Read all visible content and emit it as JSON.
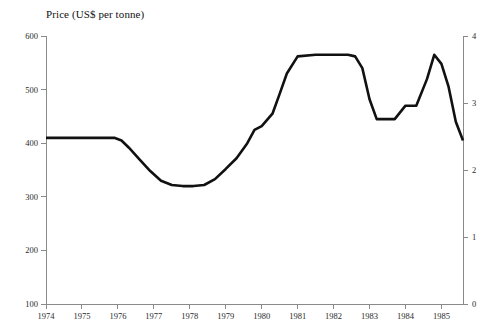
{
  "chart_data": {
    "type": "line",
    "title": "Price (US$ per tonne)",
    "xlabel": "",
    "ylabel": "",
    "ylim": [
      100,
      600
    ],
    "ylim_right": [
      0,
      4
    ],
    "xlim": [
      1974,
      1985.6
    ],
    "grid": false,
    "legend": null,
    "axis_left": {
      "ticks": [
        100,
        200,
        300,
        400,
        500,
        600
      ],
      "tick_labels": [
        "100",
        "200",
        "300",
        "400",
        "500",
        "600"
      ]
    },
    "axis_right": {
      "ticks": [
        0,
        1,
        2,
        3,
        4
      ],
      "tick_labels": [
        "0",
        "1",
        "2",
        "3",
        "4"
      ]
    },
    "axis_bottom": {
      "ticks": [
        1974,
        1975,
        1976,
        1977,
        1978,
        1979,
        1980,
        1981,
        1982,
        1983,
        1984,
        1985
      ],
      "tick_labels": [
        "1974",
        "1975",
        "1976",
        "1977",
        "1978",
        "1979",
        "1980",
        "1981",
        "1982",
        "1983",
        "1984",
        "1985"
      ]
    },
    "series": [
      {
        "name": "Price",
        "color": "#111111",
        "x": [
          1974.0,
          1974.5,
          1975.0,
          1975.5,
          1975.9,
          1976.1,
          1976.3,
          1976.6,
          1976.9,
          1977.2,
          1977.5,
          1977.8,
          1978.1,
          1978.4,
          1978.7,
          1979.0,
          1979.3,
          1979.6,
          1979.8,
          1980.0,
          1980.3,
          1980.5,
          1980.7,
          1981.0,
          1981.5,
          1982.0,
          1982.4,
          1982.6,
          1982.8,
          1983.0,
          1983.2,
          1983.5,
          1983.7,
          1984.0,
          1984.3,
          1984.6,
          1984.8,
          1985.0,
          1985.2,
          1985.4,
          1985.6
        ],
        "y": [
          410,
          410,
          410,
          410,
          410,
          405,
          392,
          370,
          348,
          330,
          322,
          320,
          320,
          322,
          333,
          352,
          372,
          400,
          425,
          432,
          455,
          492,
          530,
          562,
          565,
          565,
          565,
          562,
          540,
          482,
          445,
          445,
          445,
          470,
          470,
          520,
          565,
          548,
          505,
          440,
          405
        ]
      }
    ]
  }
}
